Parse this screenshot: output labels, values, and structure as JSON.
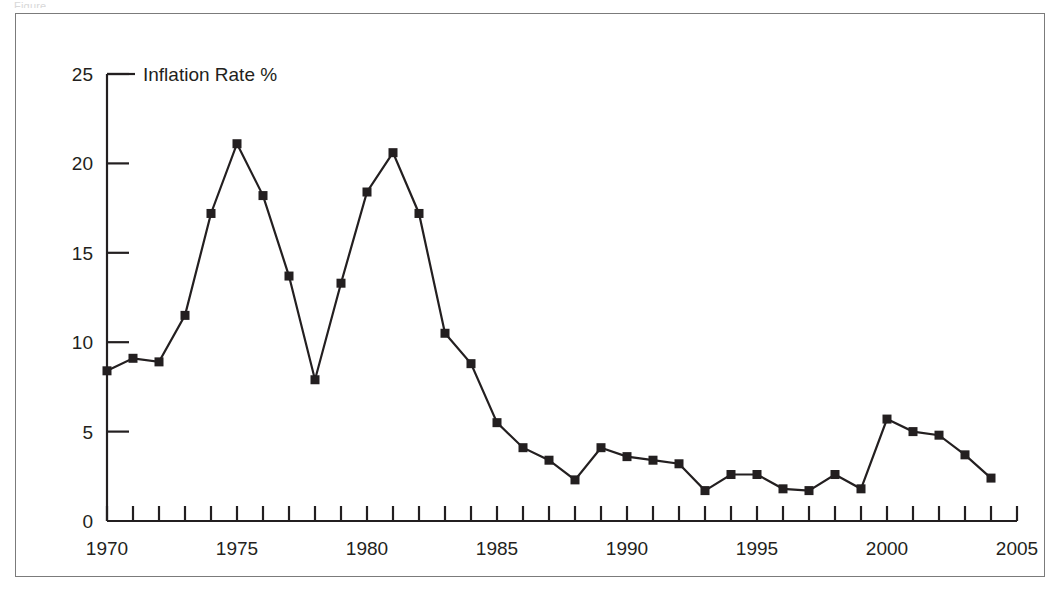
{
  "figure": {
    "caption_sliver": "Figure",
    "frame_color": "#7b7b7b",
    "background": "#ffffff",
    "line_color": "#231f20",
    "marker_color": "#231f20"
  },
  "chart_data": {
    "type": "line",
    "title": "",
    "series_label": "Inflation Rate %",
    "xlabel": "",
    "ylabel": "Inflation Rate %",
    "xlim": [
      1970,
      2005
    ],
    "ylim": [
      0,
      25
    ],
    "xticks": [
      1970,
      1971,
      1972,
      1973,
      1974,
      1975,
      1976,
      1977,
      1978,
      1979,
      1980,
      1981,
      1982,
      1983,
      1984,
      1985,
      1986,
      1987,
      1988,
      1989,
      1990,
      1991,
      1992,
      1993,
      1994,
      1995,
      1996,
      1997,
      1998,
      1999,
      2000,
      2001,
      2002,
      2003,
      2004,
      2005
    ],
    "xtick_labels": [
      "1970",
      "1975",
      "1980",
      "1985",
      "1990",
      "1995",
      "2000",
      "2005"
    ],
    "xtick_label_values": [
      1970,
      1975,
      1980,
      1985,
      1990,
      1995,
      2000,
      2005
    ],
    "ytick_labels": [
      "0",
      "5",
      "10",
      "15",
      "20",
      "25"
    ],
    "yticks": [
      0,
      5,
      10,
      15,
      20,
      25
    ],
    "grid": false,
    "legend": "none",
    "marker": "square",
    "x": [
      1970,
      1971,
      1972,
      1973,
      1974,
      1975,
      1976,
      1977,
      1978,
      1979,
      1980,
      1981,
      1982,
      1983,
      1984,
      1985,
      1986,
      1987,
      1988,
      1989,
      1990,
      1991,
      1992,
      1993,
      1994,
      1995,
      1996,
      1997,
      1998,
      1999,
      2000,
      2001,
      2002,
      2003,
      2004
    ],
    "values": [
      8.4,
      9.1,
      8.9,
      11.5,
      17.2,
      21.1,
      18.2,
      13.7,
      7.9,
      13.3,
      18.4,
      20.6,
      17.2,
      10.5,
      8.8,
      5.5,
      4.1,
      3.4,
      2.3,
      4.1,
      3.6,
      3.4,
      3.2,
      1.7,
      2.6,
      2.6,
      1.8,
      1.7,
      2.6,
      1.8,
      5.7,
      5.0,
      4.8,
      3.7,
      2.4
    ]
  }
}
